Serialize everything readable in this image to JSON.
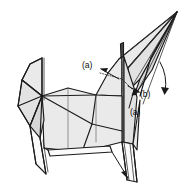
{
  "figure": {
    "background_color": "#ffffff",
    "line_color": "#1a1a1a",
    "paper_fill_light": "#eaeaea",
    "paper_fill_mid": "#e2e2e2",
    "paper_fill_dark": "#d6d6d6",
    "paper_fill_white": "#fbfbfb",
    "shadow_fill": "#4a4a4a"
  },
  "annotations": {
    "labels": [
      {
        "id": "label-a-upper",
        "text": "(a)",
        "x": 84,
        "y": 65
      },
      {
        "id": "label-b",
        "text": "(b)",
        "x": 142,
        "y": 94
      },
      {
        "id": "label-a-lower",
        "text": "(a)",
        "x": 133,
        "y": 112
      }
    ],
    "arrows": [
      {
        "id": "arrow-a-upper",
        "points_to": "crease at horn base",
        "direction": "down-right-to-up-left"
      },
      {
        "id": "arrow-b",
        "points_to": "right side panel",
        "direction": "curved-down"
      },
      {
        "id": "arrow-a-lower",
        "points_to": "lower body panel",
        "direction": "up-left"
      },
      {
        "id": "arrow-foot",
        "points_to": "bottom leg",
        "direction": "down-left"
      }
    ]
  },
  "corner": {
    "watermark": ""
  }
}
